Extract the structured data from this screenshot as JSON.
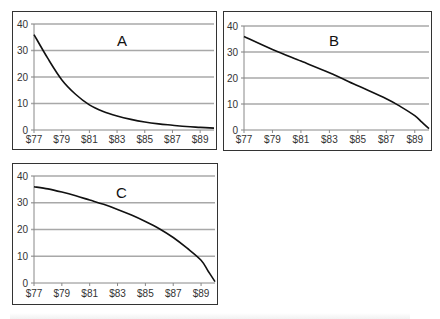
{
  "chart_data": [
    {
      "type": "line",
      "title": "A",
      "xlabel": "",
      "ylabel": "",
      "x_tick_labels": [
        "$77",
        "$79",
        "$81",
        "$83",
        "$85",
        "$87",
        "$89"
      ],
      "y_tick_labels": [
        "0",
        "10",
        "20",
        "30",
        "40"
      ],
      "xlim": [
        77,
        90
      ],
      "ylim": [
        0,
        40
      ],
      "grid": true,
      "series": [
        {
          "name": "A",
          "x": [
            77,
            78,
            79,
            80,
            81,
            82,
            83,
            84,
            85,
            86,
            87,
            88,
            89,
            90
          ],
          "values": [
            36,
            27,
            19,
            13.5,
            9.5,
            7,
            5.3,
            4,
            3,
            2.3,
            1.8,
            1.3,
            1,
            0.7
          ]
        }
      ]
    },
    {
      "type": "line",
      "title": "B",
      "xlabel": "",
      "ylabel": "",
      "x_tick_labels": [
        "$77",
        "$79",
        "$81",
        "$83",
        "$85",
        "$87",
        "$89"
      ],
      "y_tick_labels": [
        "0",
        "10",
        "20",
        "30",
        "40"
      ],
      "xlim": [
        77,
        90
      ],
      "ylim": [
        0,
        40
      ],
      "grid": true,
      "series": [
        {
          "name": "B",
          "x": [
            77,
            79,
            81,
            83,
            85,
            87,
            88,
            89,
            89.5,
            90
          ],
          "values": [
            36,
            31,
            26.5,
            22,
            17,
            12,
            9,
            5.5,
            3,
            0.5
          ]
        }
      ]
    },
    {
      "type": "line",
      "title": "C",
      "xlabel": "",
      "ylabel": "",
      "x_tick_labels": [
        "$77",
        "$79",
        "$81",
        "$83",
        "$85",
        "$87",
        "$89"
      ],
      "y_tick_labels": [
        "0",
        "10",
        "20",
        "30",
        "40"
      ],
      "xlim": [
        77,
        90
      ],
      "ylim": [
        0,
        40
      ],
      "grid": true,
      "series": [
        {
          "name": "C",
          "x": [
            77,
            78,
            79,
            80,
            81,
            82,
            83,
            84,
            85,
            86,
            87,
            88,
            89,
            89.5,
            90
          ],
          "values": [
            36,
            35.2,
            34,
            32.6,
            31,
            29.4,
            27.5,
            25.4,
            23,
            20.3,
            17,
            13,
            8.5,
            4.5,
            0.5
          ]
        }
      ]
    }
  ],
  "style": {
    "line_color": "#111111",
    "grid_color": "#a8a8a8",
    "axis_color": "#888888",
    "text_color": "#333333",
    "border_color": "#333333"
  },
  "panels": [
    {
      "label": "A"
    },
    {
      "label": "B"
    },
    {
      "label": "C"
    }
  ]
}
